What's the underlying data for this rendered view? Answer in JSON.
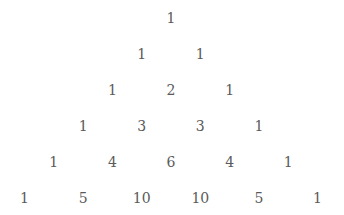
{
  "layout": {
    "center_x": 171,
    "top_y": 18,
    "row_spacing": 36,
    "half_step": 29.3
  },
  "rows": [
    [
      1
    ],
    [
      1,
      1
    ],
    [
      1,
      2,
      1
    ],
    [
      1,
      3,
      3,
      1
    ],
    [
      1,
      4,
      6,
      4,
      1
    ],
    [
      1,
      5,
      10,
      10,
      5,
      1
    ]
  ]
}
